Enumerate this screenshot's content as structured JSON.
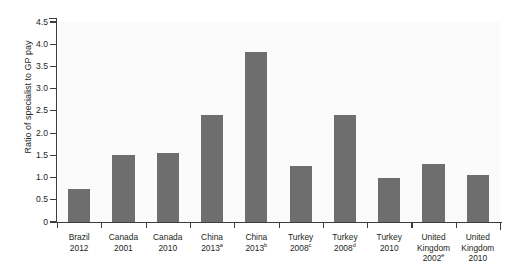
{
  "chart_data": {
    "type": "bar",
    "title": "",
    "xlabel": "",
    "ylabel": "Ratio of specialist to GP pay",
    "ylim": [
      0,
      4.5
    ],
    "ytick_step": 0.5,
    "grid": false,
    "legend": null,
    "bar_color": "#6e6e6e",
    "plot_background": "#fbfbfb",
    "axis_color": "#3d3d3d",
    "ytick_labels": [
      "0",
      "0.5",
      "1.0",
      "1.5",
      "2.0",
      "2.5",
      "3.0",
      "3.5",
      "4.0",
      "4.5"
    ],
    "ytick_values": [
      0,
      0.5,
      1.0,
      1.5,
      2.0,
      2.5,
      3.0,
      3.5,
      4.0,
      4.5
    ],
    "categories": [
      {
        "country": "Brazil",
        "year": "2012",
        "note": ""
      },
      {
        "country": "Canada",
        "year": "2001",
        "note": ""
      },
      {
        "country": "Canada",
        "year": "2010",
        "note": ""
      },
      {
        "country": "China",
        "year": "2013",
        "note": "a"
      },
      {
        "country": "China",
        "year": "2013",
        "note": "b"
      },
      {
        "country": "Turkey",
        "year": "2008",
        "note": "c"
      },
      {
        "country": "Turkey",
        "year": "2008",
        "note": "d"
      },
      {
        "country": "Turkey",
        "year": "2010",
        "note": ""
      },
      {
        "country": "United Kingdom",
        "year": "2002",
        "note": "e"
      },
      {
        "country": "United Kingdom",
        "year": "2010",
        "note": ""
      }
    ],
    "values": [
      0.75,
      1.5,
      1.55,
      2.4,
      3.82,
      1.25,
      2.4,
      1.0,
      1.3,
      1.05
    ]
  },
  "scan": {
    "top_artifact_text": "  ·   ·     ·  ·   ·      ·   ·  ·              ·"
  }
}
